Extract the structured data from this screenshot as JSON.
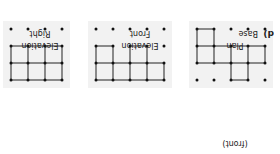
{
  "figure": {
    "part_label": "d)",
    "panels": [
      {
        "id": "base-plan",
        "title_lines": [
          "Base",
          "Plan"
        ],
        "annotation": "(front)",
        "cols": 5,
        "rows": 4,
        "segments": [
          [
            [
              0,
              1
            ],
            [
              0,
              2
            ]
          ],
          [
            [
              0,
              1
            ],
            [
              1,
              1
            ]
          ],
          [
            [
              0,
              2
            ],
            [
              1,
              2
            ]
          ],
          [
            [
              1,
              0
            ],
            [
              1,
              1
            ]
          ],
          [
            [
              1,
              1
            ],
            [
              1,
              2
            ]
          ],
          [
            [
              1,
              0
            ],
            [
              2,
              0
            ]
          ],
          [
            [
              2,
              0
            ],
            [
              2,
              1
            ]
          ],
          [
            [
              1,
              1
            ],
            [
              2,
              1
            ]
          ],
          [
            [
              1,
              2
            ],
            [
              2,
              2
            ]
          ],
          [
            [
              2,
              1
            ],
            [
              2,
              2
            ]
          ],
          [
            [
              2,
              1
            ],
            [
              3,
              1
            ]
          ],
          [
            [
              2,
              2
            ],
            [
              3,
              2
            ]
          ],
          [
            [
              3,
              1
            ],
            [
              3,
              2
            ]
          ],
          [
            [
              3,
              2
            ],
            [
              3,
              3
            ]
          ],
          [
            [
              3,
              1
            ],
            [
              4,
              1
            ]
          ],
          [
            [
              3,
              2
            ],
            [
              4,
              2
            ]
          ],
          [
            [
              4,
              1
            ],
            [
              4,
              2
            ]
          ],
          [
            [
              4,
              2
            ],
            [
              4,
              3
            ]
          ],
          [
            [
              3,
              3
            ],
            [
              4,
              3
            ]
          ]
        ]
      },
      {
        "id": "front-elevation",
        "title_lines": [
          "Front",
          "Elevation"
        ],
        "cols": 5,
        "rows": 4,
        "segments": [
          [
            [
              0,
              0
            ],
            [
              1,
              0
            ]
          ],
          [
            [
              1,
              0
            ],
            [
              2,
              0
            ]
          ],
          [
            [
              2,
              0
            ],
            [
              3,
              0
            ]
          ],
          [
            [
              3,
              0
            ],
            [
              4,
              0
            ]
          ],
          [
            [
              0,
              0
            ],
            [
              0,
              1
            ]
          ],
          [
            [
              1,
              0
            ],
            [
              1,
              1
            ]
          ],
          [
            [
              2,
              0
            ],
            [
              2,
              1
            ]
          ],
          [
            [
              3,
              0
            ],
            [
              3,
              1
            ]
          ],
          [
            [
              4,
              0
            ],
            [
              4,
              1
            ]
          ],
          [
            [
              0,
              1
            ],
            [
              1,
              1
            ]
          ],
          [
            [
              1,
              1
            ],
            [
              2,
              1
            ]
          ],
          [
            [
              2,
              1
            ],
            [
              3,
              1
            ]
          ],
          [
            [
              3,
              1
            ],
            [
              4,
              1
            ]
          ],
          [
            [
              1,
              1
            ],
            [
              1,
              2
            ]
          ],
          [
            [
              2,
              1
            ],
            [
              2,
              2
            ]
          ],
          [
            [
              1,
              2
            ],
            [
              2,
              2
            ]
          ],
          [
            [
              3,
              1
            ],
            [
              3,
              2
            ]
          ],
          [
            [
              4,
              1
            ],
            [
              4,
              2
            ]
          ],
          [
            [
              3,
              2
            ],
            [
              4,
              2
            ]
          ]
        ]
      },
      {
        "id": "right-elevation",
        "title_lines": [
          "Right",
          "Elevation"
        ],
        "cols": 4,
        "rows": 4,
        "segments": [
          [
            [
              0,
              0
            ],
            [
              1,
              0
            ]
          ],
          [
            [
              1,
              0
            ],
            [
              2,
              0
            ]
          ],
          [
            [
              2,
              0
            ],
            [
              3,
              0
            ]
          ],
          [
            [
              0,
              0
            ],
            [
              0,
              1
            ]
          ],
          [
            [
              1,
              0
            ],
            [
              1,
              1
            ]
          ],
          [
            [
              2,
              0
            ],
            [
              2,
              1
            ]
          ],
          [
            [
              3,
              0
            ],
            [
              3,
              1
            ]
          ],
          [
            [
              0,
              1
            ],
            [
              1,
              1
            ]
          ],
          [
            [
              1,
              1
            ],
            [
              2,
              1
            ]
          ],
          [
            [
              2,
              1
            ],
            [
              3,
              1
            ]
          ],
          [
            [
              0,
              1
            ],
            [
              0,
              2
            ]
          ],
          [
            [
              1,
              1
            ],
            [
              1,
              2
            ]
          ],
          [
            [
              2,
              1
            ],
            [
              2,
              2
            ]
          ],
          [
            [
              3,
              1
            ],
            [
              3,
              2
            ]
          ],
          [
            [
              0,
              2
            ],
            [
              1,
              2
            ]
          ],
          [
            [
              1,
              2
            ],
            [
              2,
              2
            ]
          ],
          [
            [
              2,
              2
            ],
            [
              3,
              2
            ]
          ]
        ]
      }
    ]
  }
}
